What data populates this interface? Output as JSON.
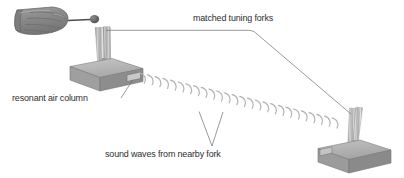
{
  "diagram": {
    "background_color": "#ffffff",
    "ink_color": "#2e2e2e",
    "labels": {
      "matched_forks": "matched tuning forks",
      "resonant_air_column": "resonant air column",
      "sound_waves": "sound waves from nearby fork"
    },
    "objects": {
      "hand": "hand-holding-mallet",
      "mallet": "rubber-mallet-striker",
      "left_fork": "struck-tuning-fork",
      "left_box": "resonance-box-left",
      "right_fork": "sympathetic-tuning-fork",
      "right_box": "resonance-box-right",
      "waves": "sound-wave-arcs"
    },
    "colors": {
      "box_top": "#b9b9b9",
      "box_front": "#9a9a9a",
      "box_side": "#8a8a8a",
      "fork_metal": "#c9c9c9",
      "hand_fill": "#8f8f8f",
      "wave_stroke": "#b3b3b3",
      "leader_line": "#6f6f6f"
    },
    "wave_count": 26
  }
}
